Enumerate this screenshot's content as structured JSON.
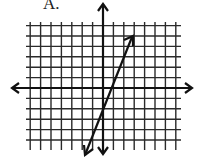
{
  "label": "A.",
  "chart_data": {
    "type": "line",
    "title": "A.",
    "xlabel": "",
    "ylabel": "",
    "grid": true,
    "xlim": [
      -7,
      7
    ],
    "ylim": [
      -6,
      6
    ],
    "series": [
      {
        "name": "line",
        "points": [
          [
            -2,
            -6.5
          ],
          [
            0,
            -2
          ],
          [
            3,
            5
          ]
        ],
        "arrows": "both"
      }
    ]
  },
  "colors": {
    "line": "#1a1a1a",
    "grid": "#2a2a2a",
    "background": "#ffffff"
  }
}
